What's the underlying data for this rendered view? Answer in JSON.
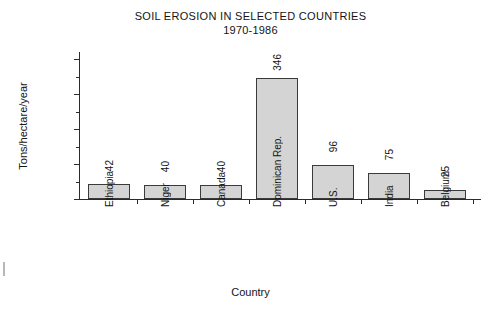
{
  "chart_data": {
    "type": "bar",
    "title": "SOIL EROSION IN SELECTED COUNTRIES",
    "subtitle": "1970-1986",
    "xlabel": "Country",
    "ylabel": "Tons/hectare/year",
    "categories": [
      "Ethiopia",
      "Niger",
      "Canada",
      "Dominican Rep.",
      "U.S.",
      "India",
      "Belgium"
    ],
    "values": [
      42,
      40,
      40,
      346,
      96,
      75,
      25
    ],
    "ylim": [
      0,
      420
    ],
    "yticks": [
      0,
      100,
      200,
      300,
      400
    ],
    "yticklabels": [
      "0",
      "100",
      "200",
      "300",
      "400"
    ],
    "yminorticks": [
      50,
      150,
      250,
      350
    ],
    "grid": false,
    "legend": null,
    "bar_fill": "#d4d4d4",
    "bar_edge": "#3a3a3a",
    "axis_color": "#2b2b2b",
    "background": "#ffffff",
    "value_labels_rotated": true
  }
}
